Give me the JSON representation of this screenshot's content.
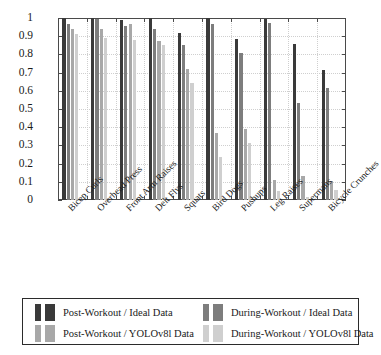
{
  "chart_data": {
    "type": "bar",
    "title": "",
    "subtitle": "",
    "xlabel": "",
    "ylabel": "",
    "ylim": [
      0,
      1
    ],
    "ytick_labels": [
      "1",
      "0.9",
      "0.8",
      "0.7",
      "0.6",
      "0.5",
      "0.4",
      "0.3",
      "0.2",
      "0.1",
      "0"
    ],
    "ytick_values": [
      1,
      0.9,
      0.8,
      0.7,
      0.6,
      0.5,
      0.4,
      0.3,
      0.2,
      0.1,
      0
    ],
    "grid": true,
    "legend_position": "bottom",
    "categories": [
      "Bicep Curls",
      "Overhead Press",
      "Front Arm Raises",
      "Delt Flys",
      "Squats",
      "Bird Dogs",
      "Pushups",
      "Leg Raises",
      "Supermans",
      "Bicycle Crunches"
    ],
    "series": [
      {
        "name": "Post-Workout / Ideal Data",
        "color": "#3a3a3a",
        "values": [
          1.0,
          1.0,
          0.99,
          1.0,
          0.915,
          1.0,
          0.885,
          0.995,
          0.855,
          0.712
        ]
      },
      {
        "name": "During-Workout / Ideal Data",
        "color": "#7d7d7d",
        "values": [
          0.965,
          0.995,
          0.958,
          0.94,
          0.852,
          0.968,
          0.808,
          0.975,
          0.532,
          0.618
        ]
      },
      {
        "name": "Post-Workout / YOLOv8l Data",
        "color": "#a8a8a8",
        "values": [
          0.938,
          0.94,
          0.968,
          0.875,
          0.722,
          0.368,
          0.392,
          0.108,
          0.131,
          0.102
        ]
      },
      {
        "name": "During-Workout / YOLOv8l Data",
        "color": "#cfcfcf",
        "values": [
          0.912,
          0.888,
          0.878,
          0.85,
          0.645,
          0.238,
          0.315,
          0.048,
          0.015,
          0.055
        ]
      }
    ]
  },
  "legend": {
    "entries": [
      {
        "label": "Post-Workout / Ideal Data",
        "color": "#3a3a3a"
      },
      {
        "label": "During-Workout / Ideal Data",
        "color": "#7d7d7d"
      },
      {
        "label": "Post-Workout / YOLOv8l Data",
        "color": "#a8a8a8"
      },
      {
        "label": "During-Workout / YOLOv8l Data",
        "color": "#cfcfcf"
      }
    ]
  },
  "colors": {
    "axis": "#4a4a4a",
    "grid": "#cfcfcf",
    "text": "#1a1a1a",
    "background": "#ffffff",
    "legend_border": "#2b2b2b"
  }
}
